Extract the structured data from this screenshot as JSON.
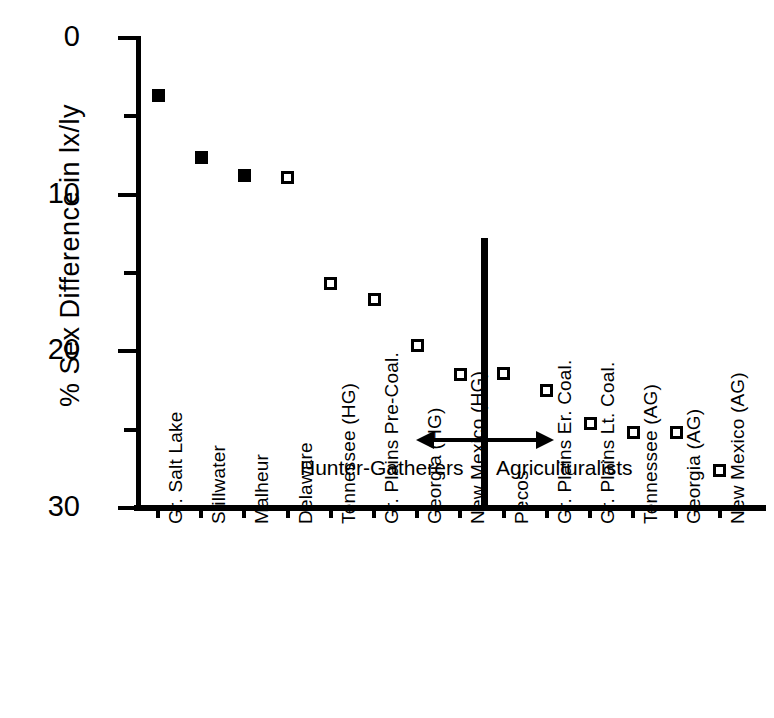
{
  "chart_data": {
    "type": "scatter",
    "title": "",
    "xlabel": "",
    "ylabel": "% Sex Difference in lx/ly",
    "ylim": [
      0,
      30
    ],
    "yticks": [
      0,
      10,
      20,
      30
    ],
    "yticks_minor": [
      5,
      15,
      25
    ],
    "grid": false,
    "legend": "none",
    "categories": [
      "Gr. Salt Lake",
      "Stillwater",
      "Malheur",
      "Delaware",
      "Tennessee (HG)",
      "Gr. Plains Pre-Coal.",
      "Georgia (HG)",
      "New Mexico (HG)",
      "Pecos",
      "Gr. Plains Er. Coal.",
      "Gr. Plains Lt. Coal.",
      "Tennessee (AG)",
      "Georgia (AG)",
      "New Mexico (AG)"
    ],
    "values": [
      26.3,
      22.4,
      21.2,
      21.1,
      14.3,
      13.3,
      10.4,
      8.5,
      8.6,
      7.5,
      5.4,
      4.8,
      4.8,
      2.4
    ],
    "marker_styles": [
      "filled",
      "filled",
      "filled",
      "open",
      "open",
      "open",
      "open",
      "open",
      "open",
      "open",
      "open",
      "open",
      "open",
      "open"
    ],
    "annotations": [
      {
        "name": "group-divider",
        "type": "vertical-line",
        "x_between": [
          "New Mexico (HG)",
          "Pecos"
        ]
      },
      {
        "name": "span-arrow",
        "type": "double-headed-arrow",
        "y": 3.5
      },
      {
        "name": "hunter-gatherers-label",
        "text": "Hunter-Gatherers"
      },
      {
        "name": "agriculturalists-label",
        "text": "Agriculturalists"
      }
    ],
    "colors": {
      "axis": "#000000",
      "marker": "#000000",
      "background": "#ffffff"
    }
  },
  "axis": {
    "y_title": "% Sex Difference in lx/ly",
    "y_tick_labels": [
      "30",
      "20",
      "10",
      "0"
    ]
  },
  "annotations": {
    "hunter_gatherers": "Hunter-Gatherers",
    "agriculturalists": "Agriculturalists"
  }
}
